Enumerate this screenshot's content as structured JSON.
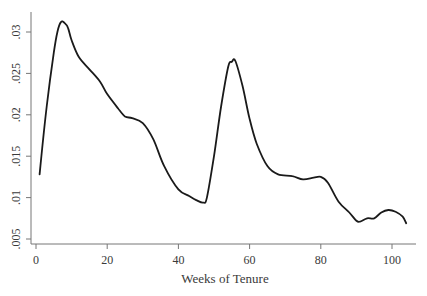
{
  "chart_data": {
    "type": "line",
    "title": "",
    "xlabel": "Weeks of Tenure",
    "ylabel": "",
    "xlim": [
      0,
      105
    ],
    "ylim": [
      0.005,
      0.0315
    ],
    "grid": false,
    "legend": null,
    "x_ticks": [
      0,
      20,
      40,
      60,
      80,
      100
    ],
    "x_tick_labels": [
      "0",
      "20",
      "40",
      "60",
      "80",
      "100"
    ],
    "y_ticks": [
      0.005,
      0.01,
      0.015,
      0.02,
      0.025,
      0.03
    ],
    "y_tick_labels": [
      ".005",
      ".01",
      ".015",
      ".02",
      ".025",
      ".03"
    ],
    "series": [
      {
        "name": "density",
        "color": "#1a1a1a",
        "x": [
          1,
          3,
          5,
          6,
          7,
          8,
          9,
          10,
          12,
          15,
          18,
          20,
          23,
          25,
          27,
          30,
          33,
          36,
          40,
          43,
          45,
          47,
          48,
          50,
          52,
          54,
          55,
          56,
          58,
          60,
          62,
          65,
          68,
          72,
          75,
          78,
          80,
          82,
          85,
          88,
          90,
          91,
          93,
          95,
          97,
          99,
          101,
          103,
          104
        ],
        "values": [
          0.0128,
          0.021,
          0.0275,
          0.03,
          0.0312,
          0.0311,
          0.0305,
          0.029,
          0.027,
          0.0255,
          0.024,
          0.0225,
          0.0208,
          0.0198,
          0.0196,
          0.019,
          0.017,
          0.0138,
          0.011,
          0.0102,
          0.0097,
          0.0094,
          0.01,
          0.015,
          0.021,
          0.0258,
          0.0264,
          0.0265,
          0.0235,
          0.0195,
          0.0165,
          0.0138,
          0.0128,
          0.0126,
          0.0122,
          0.0124,
          0.0125,
          0.0118,
          0.0095,
          0.0082,
          0.0072,
          0.0071,
          0.0075,
          0.0075,
          0.0082,
          0.0085,
          0.0083,
          0.0077,
          0.0069
        ]
      }
    ]
  },
  "labels": {
    "x_axis_title": "Weeks of Tenure"
  }
}
